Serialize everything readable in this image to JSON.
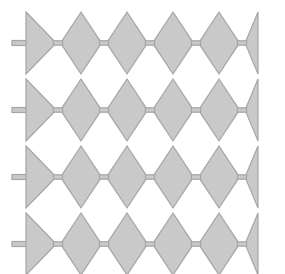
{
  "figure": {
    "canvas": {
      "width": 285,
      "height": 274,
      "background": "#ffffff"
    },
    "style": {
      "fill": "#c9c9c9",
      "stroke": "#a6a6a6",
      "stroke_width": 1.2,
      "stem_fill": "#c9c9c9",
      "stem_stroke": "#a6a6a6"
    },
    "geometry": {
      "left_x": 26,
      "right_x": 258,
      "neck_half_width": 4,
      "neck_half_height": 2.2,
      "cell_pitch": 46,
      "row_height": 62,
      "row_gap": 5,
      "first_row_top": 12,
      "rows": 4,
      "full_diamonds_per_row": 4,
      "edge_triangles_per_row": 2,
      "neck_count_per_row": 5,
      "neck_x_positions": [
        58,
        104,
        150,
        196,
        242
      ],
      "stem": {
        "width": 14,
        "height": 5,
        "x": 12
      }
    },
    "rows": [
      {
        "index": 1,
        "label": "row-1",
        "top": 12,
        "mid": 43,
        "bottom": 74,
        "cells": 4
      },
      {
        "index": 2,
        "label": "row-2",
        "top": 79,
        "mid": 110,
        "bottom": 141,
        "cells": 4
      },
      {
        "index": 3,
        "label": "row-3",
        "top": 146,
        "mid": 177,
        "bottom": 208,
        "cells": 4
      },
      {
        "index": 4,
        "label": "row-4",
        "top": 213,
        "mid": 244,
        "bottom": 275,
        "cells": 4
      }
    ]
  }
}
